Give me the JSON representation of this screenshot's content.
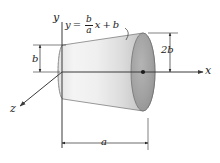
{
  "figure": {
    "background_color": "#ffffff"
  },
  "axes": {
    "x_label": "x",
    "y_label": "y",
    "z_label": "z",
    "origin_x": 62,
    "origin_y": 72
  },
  "equation": {
    "lhs": "y",
    "equals": "=",
    "fraction_numerator": "b",
    "fraction_denominator": "a",
    "variable": "x",
    "plus": "+",
    "constant": "b",
    "full_text": "y = (b/a) x + b"
  },
  "dimensions": [
    {
      "name": "left-radius",
      "label": "b",
      "orientation": "vertical",
      "x": 40,
      "y_top": 45,
      "y_bottom": 72
    },
    {
      "name": "right-diameter",
      "label": "2b",
      "orientation": "vertical",
      "x": 170,
      "y_top": 33,
      "y_bottom": 72
    },
    {
      "name": "length",
      "label": "a",
      "orientation": "horizontal",
      "y": 143,
      "x_left": 62,
      "x_right": 148
    }
  ],
  "solid": {
    "type": "frustum",
    "left_face_center": [
      63,
      72
    ],
    "left_face_ry": 27,
    "right_face_center": [
      143,
      72
    ],
    "right_face_ry": 39,
    "right_face_rx": 12,
    "body_fill_light": "#f2f2f2",
    "body_fill_dark": "#b6b6b6",
    "face_fill": "#9d9d9d",
    "outline_color": "#6e6e6e"
  },
  "colors": {
    "ink": "#1c1c1c",
    "axis": "#3a3a3a",
    "dimension": "#2b2b2b"
  }
}
